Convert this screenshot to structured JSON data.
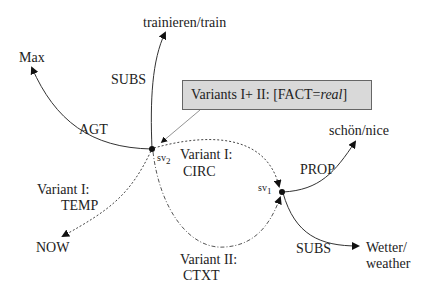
{
  "diagram": {
    "nodes": {
      "sv2": {
        "label": "sv",
        "sub": "2"
      },
      "sv1": {
        "label": "sv",
        "sub": "1"
      },
      "max": "Max",
      "train": "trainieren/train",
      "now": "NOW",
      "nice": "schön/nice",
      "weather_1": "Wetter/",
      "weather_2": "weather"
    },
    "edges": {
      "agt": "AGT",
      "subs_train": "SUBS",
      "temp_1": "Variant I:",
      "temp_2": "TEMP",
      "circ_1": "Variant I:",
      "circ_2": "CIRC",
      "ctxt_1": "Variant II:",
      "ctxt_2": "CTXT",
      "prop": "PROP",
      "subs_weather": "SUBS"
    },
    "annotation": {
      "prefix": "Variants I+ II: [FACT=",
      "italic": "real",
      "suffix": "]"
    }
  }
}
